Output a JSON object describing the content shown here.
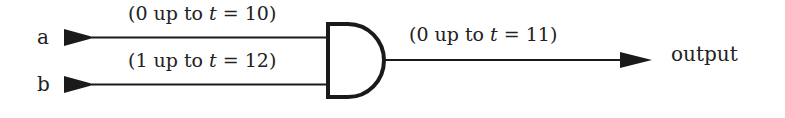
{
  "diagram": {
    "type": "logic-gate",
    "gate": "AND",
    "inputs": [
      {
        "name": "a",
        "annotation_pre": "(0 up to ",
        "annotation_var": "t",
        "annotation_post": " = 10)"
      },
      {
        "name": "b",
        "annotation_pre": "(1 up to ",
        "annotation_var": "t",
        "annotation_post": " = 12)"
      }
    ],
    "output": {
      "name": "output",
      "annotation_pre": "(0 up to ",
      "annotation_var": "t",
      "annotation_post": " = 11)"
    },
    "colors": {
      "stroke": "#1a1a1a",
      "text": "#222222",
      "background": "#ffffff"
    }
  }
}
